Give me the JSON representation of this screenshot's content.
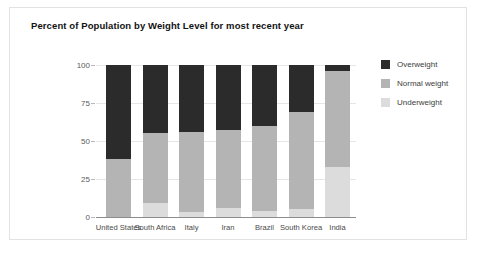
{
  "card": {
    "title": "Percent of Population by Weight Level for most recent year"
  },
  "legend": {
    "items": [
      {
        "label": "Overweight",
        "color": "#2b2b2b",
        "key": "overweight"
      },
      {
        "label": "Normal weight",
        "color": "#b4b4b4",
        "key": "normal"
      },
      {
        "label": "Underweight",
        "color": "#dcdcdc",
        "key": "underweight"
      }
    ]
  },
  "axis": {
    "y_ticks": [
      "100",
      "75",
      "50",
      "25",
      "0"
    ]
  },
  "chart_data": {
    "type": "bar",
    "stacked": true,
    "title": "Percent of Population by Weight Level for most recent year",
    "xlabel": "",
    "ylabel": "",
    "ylim": [
      0,
      100
    ],
    "yticks": [
      0,
      25,
      50,
      75,
      100
    ],
    "grid": true,
    "legend_position": "right",
    "categories": [
      "United States",
      "South Africa",
      "Italy",
      "Iran",
      "Brazil",
      "South Korea",
      "India"
    ],
    "series": [
      {
        "name": "Underweight",
        "color": "#dcdcdc",
        "values": [
          0,
          9,
          3,
          6,
          4,
          5,
          33
        ]
      },
      {
        "name": "Normal weight",
        "color": "#b4b4b4",
        "values": [
          38,
          46,
          53,
          51,
          56,
          64,
          63
        ]
      },
      {
        "name": "Overweight",
        "color": "#2b2b2b",
        "values": [
          62,
          45,
          44,
          43,
          40,
          31,
          4
        ]
      }
    ],
    "cumulative_tops": {
      "underweight": [
        0,
        9,
        3,
        6,
        4,
        5,
        33
      ],
      "normal": [
        38,
        55,
        56,
        57,
        60,
        69,
        96
      ],
      "overweight": [
        100,
        100,
        100,
        100,
        100,
        100,
        100
      ]
    }
  }
}
